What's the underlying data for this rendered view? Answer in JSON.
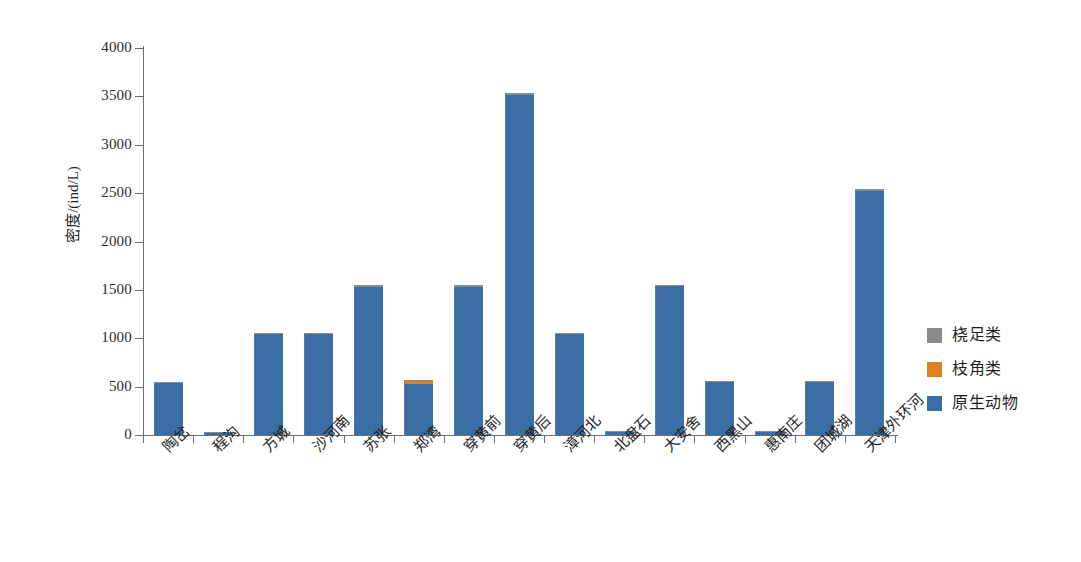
{
  "chart_data": {
    "type": "bar",
    "title": "",
    "subtitle": "",
    "xlabel": "",
    "ylabel": "密度/(ind/L)",
    "ylim": [
      0,
      4000
    ],
    "ytick_values": [
      0,
      500,
      1000,
      1500,
      2000,
      2500,
      3000,
      3500,
      4000
    ],
    "ytick_labels": [
      "0",
      "500",
      "1000",
      "1500",
      "2000",
      "2500",
      "3000",
      "3500",
      "4000"
    ],
    "grid": false,
    "stacked": true,
    "legend_position": "right",
    "categories": [
      "陶岔",
      "程沟",
      "方城",
      "沙河南",
      "苏张",
      "郑湾",
      "穿黄前",
      "穿黄后",
      "漳河北",
      "北盘石",
      "大安舍",
      "西黑山",
      "惠南庄",
      "团城湖",
      "天津外环河"
    ],
    "series": [
      {
        "name": "原生动物",
        "color": "#3b6ea5",
        "values": [
          540,
          25,
          1040,
          1040,
          1535,
          525,
          1535,
          3515,
          1045,
          28,
          1540,
          550,
          30,
          550,
          2520
        ]
      },
      {
        "name": "枝角类",
        "color": "#e0801f",
        "values": [
          0,
          0,
          0,
          0,
          0,
          30,
          0,
          0,
          0,
          0,
          0,
          0,
          0,
          0,
          0
        ]
      },
      {
        "name": "桡足类",
        "color": "#8a8a8a",
        "values": [
          10,
          5,
          10,
          10,
          15,
          5,
          15,
          25,
          10,
          5,
          15,
          10,
          5,
          10,
          20
        ]
      }
    ],
    "totals": [
      550,
      30,
      1050,
      1050,
      1550,
      560,
      1550,
      3540,
      1055,
      33,
      1555,
      560,
      35,
      560,
      2540
    ]
  },
  "legend": {
    "items": [
      {
        "label": "桡足类",
        "color": "#8a8a8a"
      },
      {
        "label": "枝角类",
        "color": "#e0801f"
      },
      {
        "label": "原生动物",
        "color": "#3b6ea5"
      }
    ]
  }
}
